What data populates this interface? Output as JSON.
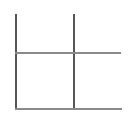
{
  "figure": {
    "width": 129,
    "height": 117,
    "background_color": "#ffffff"
  },
  "palette": {
    "vertical_stroke": "#555555",
    "horizontal_stroke": "#8a8a8a",
    "background": "#ffffff"
  },
  "chart_data": {
    "type": "line",
    "xlabel": "",
    "ylabel": "",
    "grid": false,
    "legend": "none",
    "xlim": [
      0,
      129
    ],
    "ylim": [
      0,
      117
    ],
    "series": [
      {
        "name": "left-vertical-rule",
        "orientation": "vertical",
        "x": [
          15,
          15
        ],
        "y": [
          14,
          109
        ],
        "color": "#555555",
        "width": 2
      },
      {
        "name": "right-vertical-rule",
        "orientation": "vertical",
        "x": [
          73,
          73
        ],
        "y": [
          14,
          109
        ],
        "color": "#555555",
        "width": 2
      },
      {
        "name": "upper-horizontal-rule",
        "orientation": "horizontal",
        "x": [
          15,
          121
        ],
        "y": [
          52,
          52
        ],
        "color": "#8a8a8a",
        "width": 2
      },
      {
        "name": "baseline-horizontal-rule",
        "orientation": "horizontal",
        "x": [
          15,
          122
        ],
        "y": [
          108,
          108
        ],
        "color": "#8a8a8a",
        "width": 2
      }
    ],
    "intersections": [
      {
        "name": "upper-left-crossing",
        "x": 15,
        "y": 52
      },
      {
        "name": "upper-right-crossing",
        "x": 73,
        "y": 52
      },
      {
        "name": "lower-left-corner",
        "x": 15,
        "y": 108
      },
      {
        "name": "lower-right-crossing",
        "x": 73,
        "y": 108
      }
    ]
  }
}
